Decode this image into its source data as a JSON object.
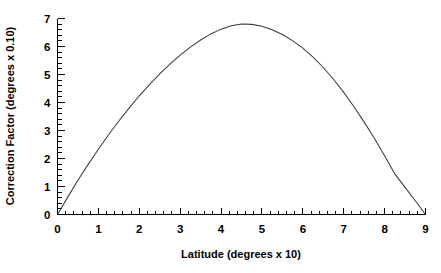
{
  "chart_data": {
    "type": "line",
    "title": "",
    "subtitle": "",
    "xlabel": "Latitude (degrees x 10)",
    "ylabel": "Correction Factor (degrees x 0.10)",
    "xlim": [
      0,
      9
    ],
    "ylim": [
      0,
      7
    ],
    "x_major_ticks": [
      0,
      1,
      2,
      3,
      4,
      5,
      6,
      7,
      8,
      9
    ],
    "y_major_ticks": [
      0,
      1,
      2,
      3,
      4,
      5,
      6,
      7
    ],
    "x_tick_labels": [
      "0",
      "1",
      "2",
      "3",
      "4",
      "5",
      "6",
      "7",
      "8",
      "9"
    ],
    "y_tick_labels": [
      "0",
      "1",
      "2",
      "3",
      "4",
      "5",
      "6",
      "7"
    ],
    "x_minor_per_major": 5,
    "y_minor_per_major": 5,
    "grid": false,
    "legend": false,
    "legend_position": "none",
    "annotations": [],
    "series": [
      {
        "name": "Correction Factor",
        "color": "#3b3b42",
        "x": [
          0.0,
          0.25,
          0.5,
          0.75,
          1.0,
          1.25,
          1.5,
          1.75,
          2.0,
          2.25,
          2.5,
          2.75,
          3.0,
          3.25,
          3.5,
          3.75,
          4.0,
          4.25,
          4.5,
          4.75,
          5.0,
          5.25,
          5.5,
          5.75,
          6.0,
          6.25,
          6.5,
          6.75,
          7.0,
          7.25,
          7.5,
          7.75,
          8.0,
          8.25,
          8.5,
          8.75,
          9.0
        ],
        "y": [
          0.0,
          0.62,
          1.22,
          1.79,
          2.33,
          2.85,
          3.34,
          3.8,
          4.24,
          4.64,
          5.02,
          5.37,
          5.69,
          5.98,
          6.23,
          6.45,
          6.62,
          6.74,
          6.8,
          6.79,
          6.72,
          6.6,
          6.43,
          6.21,
          5.94,
          5.62,
          5.25,
          4.83,
          4.36,
          3.85,
          3.3,
          2.72,
          2.1,
          1.45,
          0.97,
          0.49,
          0.0
        ]
      }
    ]
  },
  "axes": {
    "x_axis_name": "x-axis",
    "y_axis_name": "y-axis"
  }
}
